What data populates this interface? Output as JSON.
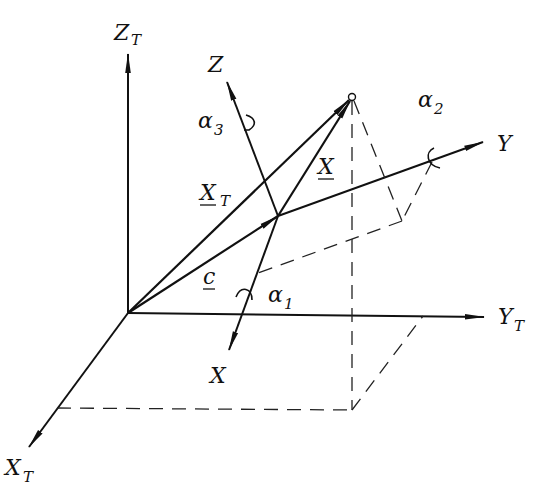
{
  "diagram": {
    "type": "coordinate-transformation",
    "labels": {
      "ZT": {
        "main": "Z",
        "sub": "T"
      },
      "YT": {
        "main": "Y",
        "sub": "T"
      },
      "XT_axis": {
        "main": "X",
        "sub": "T"
      },
      "Z": {
        "main": "Z"
      },
      "Y": {
        "main": "Y"
      },
      "X": {
        "main": "X"
      },
      "XT_vec": {
        "main": "X",
        "sub": "T"
      },
      "X_vec": {
        "main": "X"
      },
      "c_vec": {
        "main": "c"
      },
      "alpha1": {
        "main": "α",
        "sub": "1"
      },
      "alpha2": {
        "main": "α",
        "sub": "2"
      },
      "alpha3": {
        "main": "α",
        "sub": "3"
      }
    },
    "colors": {
      "line": "#111111",
      "background": "#ffffff"
    }
  }
}
